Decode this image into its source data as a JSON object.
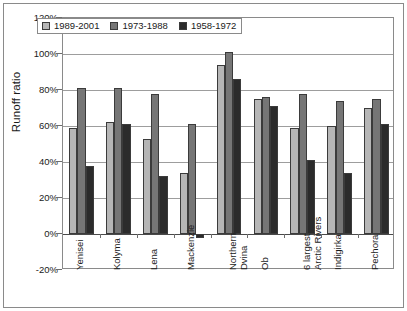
{
  "chart_data": {
    "type": "bar",
    "title": "",
    "subtitle": "",
    "xlabel": "",
    "ylabel": "Runoff ratio",
    "ylim": [
      -20,
      120
    ],
    "ytick_values": [
      120,
      100,
      80,
      60,
      40,
      20,
      0,
      -20
    ],
    "ytick_labels": [
      "120%",
      "100%",
      "80%",
      "60%",
      "40%",
      "20%",
      "0%",
      "-20%"
    ],
    "grid": true,
    "legend_position": "top-inside",
    "orientation": "vertical",
    "grouping": "clustered",
    "categories": [
      "Yenisei",
      "Kolyma",
      "Lena",
      "Mackenzie",
      "Northern Dvina",
      "Ob",
      "6 largest Arctic Rivers",
      "Indigirka",
      "Pechora"
    ],
    "category_lines": [
      [
        "Yenisei"
      ],
      [
        "Kolyma"
      ],
      [
        "Lena"
      ],
      [
        "Mackenzie"
      ],
      [
        "Northern",
        "Dvina"
      ],
      [
        "Ob"
      ],
      [
        "6 largest",
        "Arctic Rivers"
      ],
      [
        "Indigirka"
      ],
      [
        "Pechora"
      ]
    ],
    "series": [
      {
        "name": "1989-2001",
        "color": "#b6b6b6",
        "values": [
          59,
          62,
          53,
          34,
          94,
          75,
          59,
          60,
          70
        ]
      },
      {
        "name": "1973-1988",
        "color": "#767676",
        "values": [
          81,
          81,
          78,
          61,
          101,
          76,
          78,
          74,
          75
        ]
      },
      {
        "name": "1958-1972",
        "color": "#2b2b2b",
        "values": [
          38,
          61,
          32,
          -2,
          86,
          71,
          41,
          34,
          61
        ]
      }
    ],
    "value_unit": "%"
  },
  "legend": {
    "entries": [
      {
        "label": "1989-2001",
        "swatch": "light-gray-swatch"
      },
      {
        "label": "1973-1988",
        "swatch": "medium-gray-swatch"
      },
      {
        "label": "1958-1972",
        "swatch": "dark-gray-swatch"
      }
    ]
  },
  "colors": {
    "series_1989_2001": "#b6b6b6",
    "series_1973_1988": "#767676",
    "series_1958_1972": "#2b2b2b",
    "gridline": "#9d9d9d",
    "axis": "#4a4a4a",
    "border": "#8a8a8a",
    "text": "#1a1a1a",
    "background": "#ffffff"
  }
}
